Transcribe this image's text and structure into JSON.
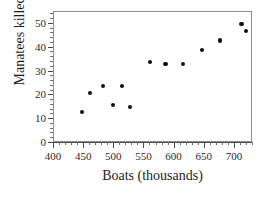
{
  "chart_data": {
    "type": "scatter",
    "title": "",
    "xlabel": "Boats (thousands)",
    "ylabel": "Manatees killed",
    "xlim": [
      400,
      730
    ],
    "ylim": [
      0,
      55
    ],
    "grid": false,
    "legend": null,
    "x_ticks": [
      400,
      450,
      500,
      550,
      600,
      650,
      700
    ],
    "y_ticks": [
      0,
      10,
      20,
      30,
      40,
      50
    ],
    "x_minor_step": 10,
    "y_minor_step": 2,
    "marker": "filled-circle",
    "marker_color": "#111111",
    "points": [
      {
        "x": 447,
        "y": 13
      },
      {
        "x": 460,
        "y": 21
      },
      {
        "x": 481,
        "y": 24
      },
      {
        "x": 498,
        "y": 16
      },
      {
        "x": 513,
        "y": 24
      },
      {
        "x": 526,
        "y": 15
      },
      {
        "x": 559,
        "y": 34
      },
      {
        "x": 585,
        "y": 33
      },
      {
        "x": 614,
        "y": 33
      },
      {
        "x": 645,
        "y": 39
      },
      {
        "x": 675,
        "y": 43
      },
      {
        "x": 711,
        "y": 50
      },
      {
        "x": 719,
        "y": 47
      }
    ]
  },
  "axes": {
    "frame_color": "#8d8d8d",
    "tick_color": "#4a4a4a"
  }
}
